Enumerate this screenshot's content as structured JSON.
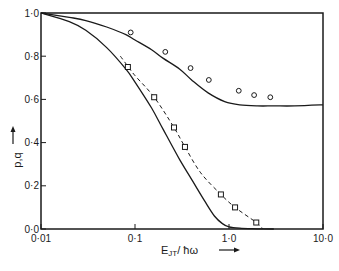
{
  "chart_data": {
    "type": "line",
    "title": "",
    "xlabel": "E_JT/ħω",
    "xlabel_parts": {
      "main": "E",
      "sub": "JT",
      "rest": "/ ħω",
      "arrow": "⟶"
    },
    "ylabel": "p,q",
    "ylabel_arrow": "⟶",
    "xscale": "log",
    "xlim": [
      0.01,
      10.0
    ],
    "ylim": [
      0.0,
      1.0
    ],
    "grid": false,
    "legend": null,
    "x_ticks": [
      {
        "value": 0.01,
        "label": "0·01"
      },
      {
        "value": 0.1,
        "label": "0·1"
      },
      {
        "value": 1.0,
        "label": "1·0"
      },
      {
        "value": 10.0,
        "label": "10·0"
      }
    ],
    "y_ticks": [
      {
        "value": 0.0,
        "label": "0·0"
      },
      {
        "value": 0.2,
        "label": "0·2"
      },
      {
        "value": 0.4,
        "label": "0·4"
      },
      {
        "value": 0.6,
        "label": "0·6"
      },
      {
        "value": 0.8,
        "label": "0·8"
      },
      {
        "value": 1.0,
        "label": "1·0"
      }
    ],
    "series": [
      {
        "name": "theory-upper (solid)",
        "style": "solid",
        "x": [
          0.01,
          0.02,
          0.03,
          0.05,
          0.08,
          0.1,
          0.15,
          0.2,
          0.3,
          0.4,
          0.6,
          0.9,
          1.3,
          2.0,
          3.0,
          5.0,
          10.0
        ],
        "y": [
          1.0,
          0.98,
          0.965,
          0.935,
          0.9,
          0.875,
          0.83,
          0.79,
          0.74,
          0.69,
          0.63,
          0.59,
          0.575,
          0.57,
          0.57,
          0.57,
          0.575
        ]
      },
      {
        "name": "theory-lower (solid)",
        "style": "solid",
        "x": [
          0.01,
          0.02,
          0.03,
          0.05,
          0.08,
          0.1,
          0.15,
          0.2,
          0.3,
          0.4,
          0.55,
          0.7,
          0.85,
          1.0,
          1.3,
          2.0,
          3.0
        ],
        "y": [
          1.0,
          0.96,
          0.92,
          0.84,
          0.74,
          0.68,
          0.56,
          0.46,
          0.32,
          0.23,
          0.13,
          0.06,
          0.025,
          0.01,
          0.004,
          0.001,
          0.0
        ]
      },
      {
        "name": "theory-dashed",
        "style": "dashed",
        "x": [
          0.07,
          0.085,
          0.1,
          0.16,
          0.26,
          0.34,
          0.5,
          0.82,
          1.16,
          1.95,
          2.3
        ],
        "y": [
          0.8,
          0.75,
          0.71,
          0.61,
          0.47,
          0.38,
          0.26,
          0.16,
          0.1,
          0.03,
          0.0
        ]
      },
      {
        "name": "data-circles",
        "style": "marker-circle",
        "x": [
          0.09,
          0.21,
          0.39,
          0.61,
          1.27,
          1.85,
          2.75
        ],
        "y": [
          0.91,
          0.82,
          0.745,
          0.69,
          0.64,
          0.62,
          0.61
        ]
      },
      {
        "name": "data-squares",
        "style": "marker-square",
        "x": [
          0.084,
          0.16,
          0.26,
          0.34,
          0.82,
          1.16,
          1.95
        ],
        "y": [
          0.75,
          0.61,
          0.47,
          0.38,
          0.16,
          0.1,
          0.03
        ]
      }
    ],
    "colors": {
      "ink": "#1a1a1a",
      "background": "#ffffff"
    }
  }
}
